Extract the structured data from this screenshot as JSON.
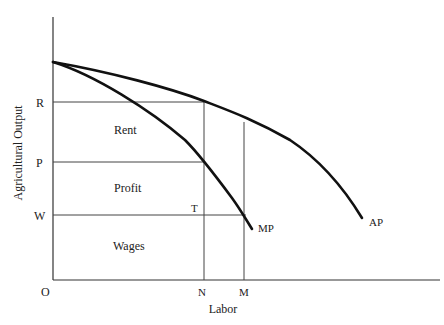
{
  "diagram": {
    "type": "economic-diagram",
    "axes": {
      "y_label": "Agricultural Output",
      "x_label": "Labor",
      "origin_label": "O"
    },
    "y_ticks": [
      {
        "label": "R",
        "y": 102
      },
      {
        "label": "P",
        "y": 162
      },
      {
        "label": "W",
        "y": 215
      }
    ],
    "x_ticks": [
      {
        "label": "N",
        "x": 204
      },
      {
        "label": "M",
        "x": 244
      }
    ],
    "curves": [
      {
        "label": "AP",
        "name": "average-product"
      },
      {
        "label": "MP",
        "name": "marginal-product"
      }
    ],
    "regions": {
      "rent": "Rent",
      "profit": "Profit",
      "wages": "Wages"
    },
    "points": {
      "t": "T"
    }
  }
}
